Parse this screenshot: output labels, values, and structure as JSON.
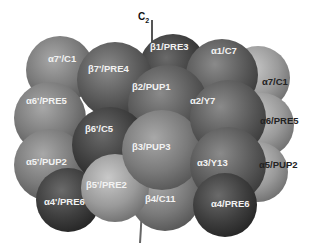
{
  "figure": {
    "axis_label": "C",
    "axis_subscript": "2",
    "subunits": [
      {
        "id": "a7p",
        "label": "α7'/C1",
        "ring": "alpha",
        "tone": "mid"
      },
      {
        "id": "b7p",
        "label": "β7'/PRE4",
        "ring": "beta",
        "tone": "dark"
      },
      {
        "id": "b1",
        "label": "β1/PRE3",
        "ring": "beta",
        "tone": "darkest"
      },
      {
        "id": "a1",
        "label": "α1/C7",
        "ring": "alpha",
        "tone": "dark"
      },
      {
        "id": "a7",
        "label": "α7/C1",
        "ring": "alpha",
        "tone": "light"
      },
      {
        "id": "a6p",
        "label": "α6'/PRE5",
        "ring": "alpha",
        "tone": "mid"
      },
      {
        "id": "b2",
        "label": "β2/PUP1",
        "ring": "beta",
        "tone": "dark"
      },
      {
        "id": "a2",
        "label": "α2/Y7",
        "ring": "alpha",
        "tone": "dark"
      },
      {
        "id": "a6",
        "label": "α6/PRE5",
        "ring": "alpha",
        "tone": "light"
      },
      {
        "id": "b6p",
        "label": "β6'/C5",
        "ring": "beta",
        "tone": "darkest"
      },
      {
        "id": "b3",
        "label": "β3/PUP3",
        "ring": "beta",
        "tone": "mid"
      },
      {
        "id": "a5p",
        "label": "α5'/PUP2",
        "ring": "alpha",
        "tone": "mid"
      },
      {
        "id": "a3",
        "label": "α3/Y13",
        "ring": "alpha",
        "tone": "dark"
      },
      {
        "id": "a5",
        "label": "α5/PUP2",
        "ring": "alpha",
        "tone": "light"
      },
      {
        "id": "b5p",
        "label": "β5'/PRE2",
        "ring": "beta",
        "tone": "light"
      },
      {
        "id": "b4",
        "label": "β4/C11",
        "ring": "beta",
        "tone": "mid"
      },
      {
        "id": "a4p",
        "label": "α4'/PRE6",
        "ring": "alpha",
        "tone": "darkest"
      },
      {
        "id": "a4",
        "label": "α4/PRE6",
        "ring": "alpha",
        "tone": "darkest"
      }
    ]
  }
}
